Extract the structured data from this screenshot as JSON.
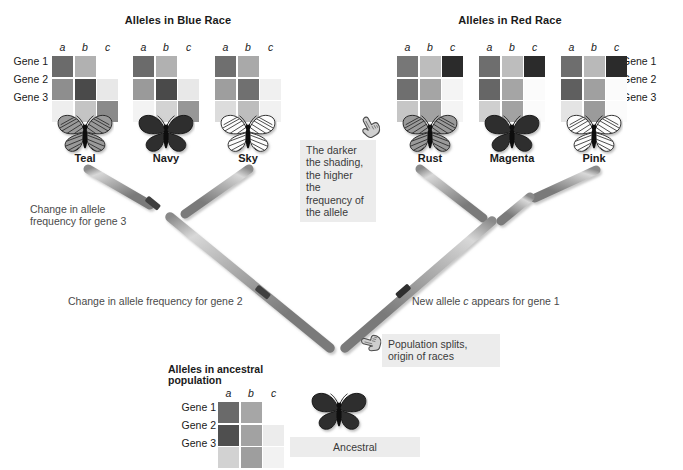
{
  "diagram": {
    "title_blue": "Alleles in Blue Race",
    "title_red": "Alleles in Red Race",
    "title_ancestral_line1": "Alleles in ancestral",
    "title_ancestral_line2": "population",
    "allele_headers": [
      "a",
      "b",
      "c"
    ],
    "gene_labels": [
      "Gene 1",
      "Gene 2",
      "Gene 3"
    ]
  },
  "callouts": {
    "shading_note": "The darker\nthe shading,\nthe higher the\nfrequency of\nthe allele",
    "gene3_change": "Change in allele\nfrequency for gene 3",
    "gene2_change": "Change in allele frequency for gene 2",
    "gene1_new_allele_pre": "New allele ",
    "gene1_new_allele_italic": "c",
    "gene1_new_allele_post": " appears for gene 1",
    "population_split": "Population splits,\norigin of races",
    "ancestral_label": "Ancestral"
  },
  "taxa": [
    {
      "name": "Teal",
      "race": "blue",
      "wing": "striped-medium",
      "grid": [
        [
          "#6b6b6b",
          "#b1b1b1",
          "#ffffff"
        ],
        [
          "#8e8e8e",
          "#4a4a4a",
          "#e8e8e8"
        ],
        [
          "#eeeeee",
          "#c4c4c4",
          "#8a8a8a"
        ]
      ]
    },
    {
      "name": "Navy",
      "race": "blue",
      "wing": "dark",
      "grid": [
        [
          "#6b6b6b",
          "#b1b1b1",
          "#ffffff"
        ],
        [
          "#9a9a9a",
          "#4a4a4a",
          "#e8e8e8"
        ],
        [
          "#f3f3f3",
          "#d3d3d3",
          "#979797"
        ]
      ]
    },
    {
      "name": "Sky",
      "race": "blue",
      "wing": "light",
      "grid": [
        [
          "#6f6f6f",
          "#a9a9a9",
          "#ffffff"
        ],
        [
          "#9e9e9e",
          "#707070",
          "#f0f0f0"
        ],
        [
          "#dcdcdc",
          "#bdbdbd",
          "#f1f1f1"
        ]
      ]
    },
    {
      "name": "Rust",
      "race": "red",
      "wing": "striped-medium",
      "grid": [
        [
          "#777777",
          "#bdbdbd",
          "#2b2b2b"
        ],
        [
          "#6f6f6f",
          "#a5a5a5",
          "#f4f4f4"
        ],
        [
          "#c6c6c6",
          "#a2a2a2",
          "#f4f4f4"
        ]
      ]
    },
    {
      "name": "Magenta",
      "race": "red",
      "wing": "dark",
      "grid": [
        [
          "#6e6e6e",
          "#bdbdbd",
          "#2b2b2b"
        ],
        [
          "#666666",
          "#a5a5a5",
          "#fbfbfb"
        ],
        [
          "#cfcfcf",
          "#a2a2a2",
          "#fbfbfb"
        ]
      ]
    },
    {
      "name": "Pink",
      "race": "red",
      "wing": "light",
      "grid": [
        [
          "#6e6e6e",
          "#b9b9b9",
          "#2b2b2b"
        ],
        [
          "#5f5f5f",
          "#a0a0a0",
          "#fbfbfb"
        ],
        [
          "#e4e4e4",
          "#9b9b9b",
          "#fbfbfb"
        ]
      ]
    }
  ],
  "ancestral": {
    "name": "Ancestral",
    "wing": "dark",
    "grid": [
      [
        "#6a6a6a",
        "#a6a6a6",
        "#ffffff"
      ],
      [
        "#4f4f4f",
        "#a2a2a2",
        "#ececec"
      ],
      [
        "#d2d2d2",
        "#9e9e9e",
        "#f2f2f2"
      ]
    ]
  },
  "colors": {
    "branch_light": "#d2d2d2",
    "branch_mid": "#9c9c9c",
    "branch_dark": "#6f6f6f",
    "marker": "#3a3a3a",
    "callout_bg": "#ececec",
    "text": "#231f20"
  },
  "icons": {
    "hand": "pointing-hand-icon",
    "butterfly": "butterfly-icon"
  }
}
